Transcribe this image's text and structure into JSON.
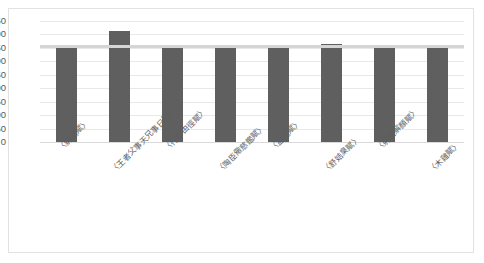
{
  "chart_data": {
    "type": "bar",
    "title": "",
    "xlabel": "",
    "ylabel": "",
    "ylim": [
      0,
      450
    ],
    "ytick_step": 50,
    "yticks": [
      450,
      400,
      350,
      300,
      250,
      200,
      150,
      100,
      50,
      0
    ],
    "grid": true,
    "legend": "none",
    "bar_color": "#5f5f5f",
    "overlay_line_color": "#d5d5d5",
    "overlay_line_value": 358,
    "categories": [
      "〈解嘲賦〉",
      "〈王者父事天兄事日賦〉",
      "〈行不由徑賦〉",
      "〈陶臣儆慈鑑賦〉",
      "〈盆池賦〉",
      "〈舒姞臬賦〉",
      "〈射雉解顏賦〉",
      "〈木雞賦〉"
    ],
    "values": [
      355,
      412,
      357,
      352,
      358,
      365,
      360,
      358
    ]
  },
  "frame": {
    "border_color": "#e2e2e2",
    "background": "#ffffff"
  }
}
